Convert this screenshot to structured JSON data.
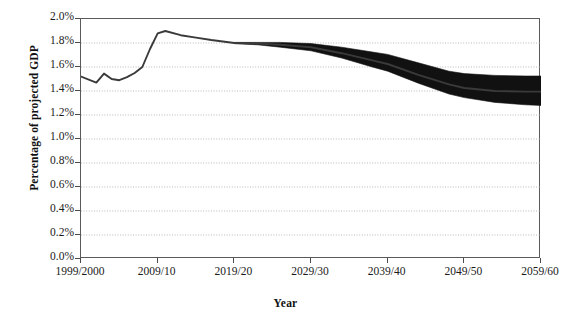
{
  "chart_data": {
    "type": "area",
    "title": "",
    "subtitle": "",
    "xlabel": "Year",
    "ylabel": "Percentage of projected GDP",
    "xlim": [
      1999,
      2059
    ],
    "ylim": [
      0.0,
      2.0
    ],
    "ytick_values": [
      0.0,
      0.2,
      0.4,
      0.6,
      0.8,
      1.0,
      1.2,
      1.4,
      1.6,
      1.8,
      2.0
    ],
    "ytick_labels": [
      "0.0%",
      "0.2%",
      "0.4%",
      "0.6%",
      "0.8%",
      "1.0%",
      "1.2%",
      "1.4%",
      "1.6%",
      "1.8%",
      "2.0%"
    ],
    "xtick_values": [
      1999,
      2009,
      2019,
      2029,
      2039,
      2049,
      2059
    ],
    "xtick_labels": [
      "1999/2000",
      "2009/10",
      "2019/20",
      "2029/30",
      "2039/40",
      "2049/50",
      "2059/60"
    ],
    "grid": "horizontal-dotted",
    "legend": "none",
    "band_color": "#111111",
    "line_color": "#3a3a3a",
    "grid_color": "#b9b9b9",
    "axis_color": "#5a5a5a",
    "series": [
      {
        "name": "Central projection",
        "x": [
          1999,
          2001,
          2002,
          2003,
          2004,
          2005,
          2006,
          2007,
          2008,
          2009,
          2010,
          2012,
          2014,
          2016,
          2019,
          2022,
          2025,
          2029,
          2033,
          2037,
          2039,
          2043,
          2047,
          2049,
          2053,
          2057,
          2059
        ],
        "values": [
          1.52,
          1.47,
          1.545,
          1.5,
          1.49,
          1.515,
          1.55,
          1.6,
          1.75,
          1.88,
          1.9,
          1.865,
          1.845,
          1.825,
          1.8,
          1.795,
          1.785,
          1.765,
          1.715,
          1.655,
          1.625,
          1.535,
          1.455,
          1.425,
          1.4,
          1.395,
          1.395
        ]
      },
      {
        "name": "Upper bound (fan)",
        "x": [
          2019,
          2022,
          2025,
          2029,
          2033,
          2037,
          2039,
          2043,
          2047,
          2049,
          2053,
          2057,
          2059
        ],
        "values": [
          1.805,
          1.805,
          1.805,
          1.795,
          1.765,
          1.725,
          1.705,
          1.635,
          1.565,
          1.545,
          1.53,
          1.525,
          1.525
        ]
      },
      {
        "name": "Lower bound (fan)",
        "x": [
          2019,
          2022,
          2025,
          2029,
          2033,
          2037,
          2039,
          2043,
          2047,
          2049,
          2053,
          2057,
          2059
        ],
        "values": [
          1.795,
          1.785,
          1.765,
          1.735,
          1.675,
          1.6,
          1.565,
          1.465,
          1.375,
          1.345,
          1.305,
          1.285,
          1.28
        ]
      }
    ]
  },
  "axis": {
    "ylabel": "Percentage of projected GDP",
    "xlabel": "Year"
  }
}
